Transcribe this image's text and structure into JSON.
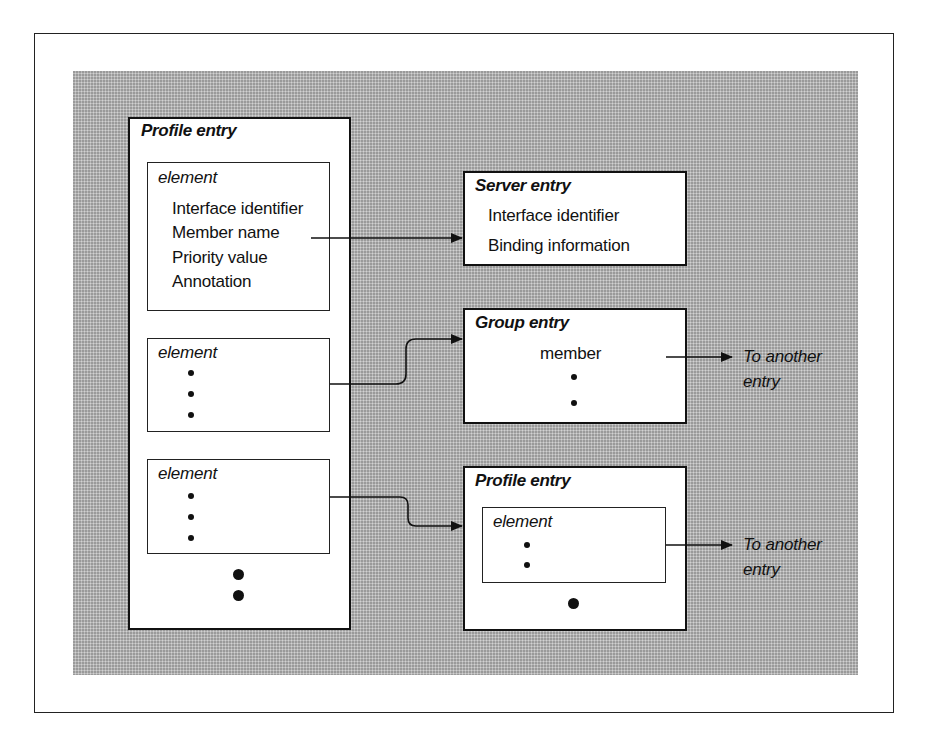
{
  "diagram": {
    "left_profile": {
      "title": "Profile entry",
      "elements": [
        {
          "label": "element",
          "fields": [
            "Interface identifier",
            "Member name",
            "Priority value",
            "Annotation"
          ]
        },
        {
          "label": "element",
          "ellipsis": 3
        },
        {
          "label": "element",
          "ellipsis": 3
        }
      ],
      "more_ellipsis": 2
    },
    "server_entry": {
      "title": "Server entry",
      "fields": [
        "Interface identifier",
        "Binding information"
      ]
    },
    "group_entry": {
      "title": "Group entry",
      "member_label": "member",
      "ellipsis": 2,
      "link_label_line1": "To another",
      "link_label_line2": "entry"
    },
    "right_profile": {
      "title": "Profile entry",
      "element_label": "element",
      "element_ellipsis": 2,
      "more_ellipsis": 1,
      "link_label_line1": "To another",
      "link_label_line2": "entry"
    },
    "connections": [
      {
        "from": "left_profile.element[0].Member name",
        "to": "server_entry"
      },
      {
        "from": "left_profile.element[1]",
        "to": "group_entry"
      },
      {
        "from": "left_profile.element[2]",
        "to": "right_profile"
      },
      {
        "from": "group_entry.member",
        "to": "another entry"
      },
      {
        "from": "right_profile.element",
        "to": "another entry"
      }
    ],
    "colors": {
      "background_fill": "#b9b9b9",
      "box_fill": "#ffffff",
      "stroke": "#111111"
    }
  }
}
